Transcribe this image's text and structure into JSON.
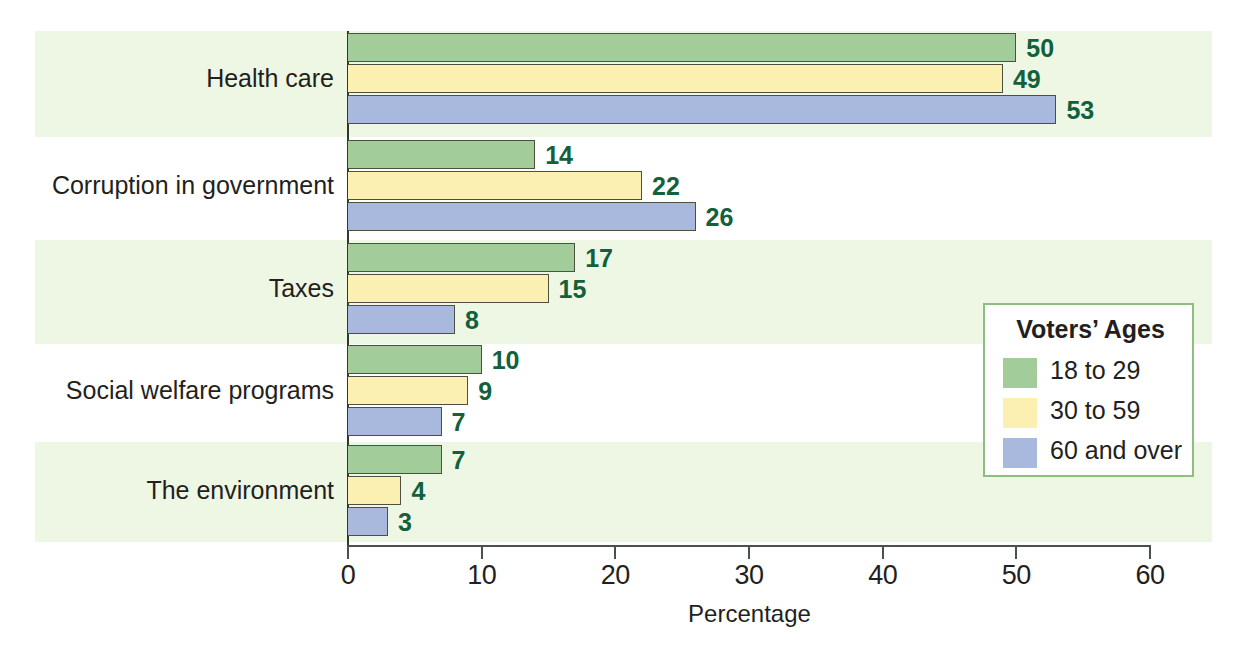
{
  "chart_data": {
    "type": "bar",
    "orientation": "horizontal",
    "title": "",
    "xlabel": "Percentage",
    "ylabel": "",
    "xlim": [
      0,
      60
    ],
    "xticks": [
      0,
      10,
      20,
      30,
      40,
      50,
      60
    ],
    "grid": false,
    "legend_position": "right-inside",
    "legend_title": "Voters’ Ages",
    "categories": [
      "Health care",
      "Corruption in government",
      "Taxes",
      "Social welfare programs",
      "The environment"
    ],
    "series": [
      {
        "name": "18 to 29",
        "color": "#a2cd9a",
        "values": [
          50,
          14,
          17,
          10,
          7
        ]
      },
      {
        "name": "30 to 59",
        "color": "#fbf0b2",
        "values": [
          49,
          22,
          15,
          9,
          4
        ]
      },
      {
        "name": "60 and over",
        "color": "#a9b9dd",
        "values": [
          53,
          26,
          8,
          7,
          3
        ]
      }
    ],
    "value_label_color": "#12603c",
    "band_color": "#eef7e4",
    "axis_color": "#4a514a"
  }
}
